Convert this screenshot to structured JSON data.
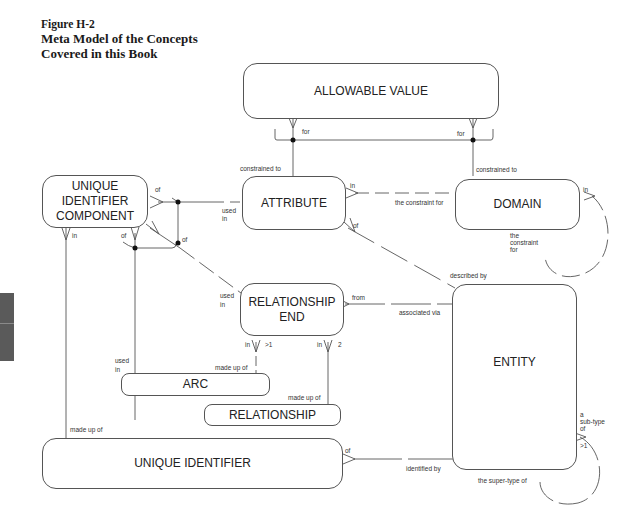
{
  "caption": {
    "figure_label": "Figure H-2",
    "title_line1": "Meta Model of the Concepts",
    "title_line2": "Covered in this Book"
  },
  "entities": {
    "allowable_value": "ALLOWABLE VALUE",
    "uic_line1": "UNIQUE",
    "uic_line2": "IDENTIFIER",
    "uic_line3": "COMPONENT",
    "attribute": "ATTRIBUTE",
    "domain": "DOMAIN",
    "rel_end_line1": "RELATIONSHIP",
    "rel_end_line2": "END",
    "entity": "ENTITY",
    "arc": "ARC",
    "relationship": "RELATIONSHIP",
    "unique_identifier": "UNIQUE IDENTIFIER"
  },
  "labels": {
    "av_for_left": "for",
    "av_for_right": "for",
    "attr_constrained_to": "constrained to",
    "domain_constrained_to": "constrained to",
    "uic_of_top": "of",
    "uic_of_left": "of",
    "uic_of_arc": "of",
    "uic_in": "in",
    "attr_used_in_1": "used",
    "attr_used_in_2": "in",
    "attr_in": "in",
    "attr_of": "of",
    "constraint_for": "the constraint for",
    "domain_in": "in",
    "domain_constraint_1": "the",
    "domain_constraint_2": "constraint",
    "domain_constraint_3": "for",
    "re_used_1": "used",
    "re_used_2": "in",
    "re_from": "from",
    "associated_via": "associated via",
    "described_by": "described by",
    "re_in_left": "in",
    "re_gt1": ">1",
    "re_in_right": "in",
    "re_2": "2",
    "arc_used_1": "used",
    "arc_used_2": "in",
    "arc_made_up_of": "made up of",
    "rel_made_up_of": "made up of",
    "ui_made_up_of": "made up of",
    "ui_of": "of",
    "identified_by": "identified by",
    "subtype_1": "a",
    "subtype_2": "sub-type",
    "subtype_3": "of",
    "subtype_gt1": ">1",
    "supertype_of": "the super-type of"
  }
}
